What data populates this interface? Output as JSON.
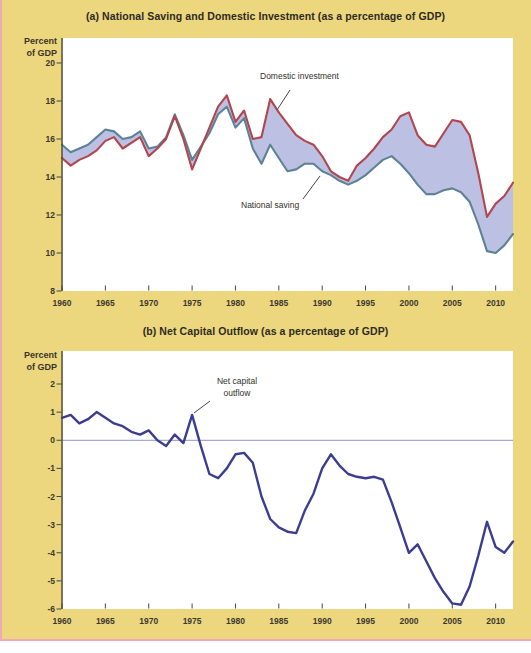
{
  "page": {
    "background": "#ecd77e",
    "edge_pink": "#efaab8",
    "bottom_strip_color": "#ffffff"
  },
  "panel_a": {
    "title": "(a) National Saving and Domestic Investment (as a percentage of GDP)",
    "ylabel_line1": "Percent",
    "ylabel_line2": "of GDP",
    "y_tick_labels": [
      "20",
      "18",
      "16",
      "14",
      "12",
      "10",
      "8"
    ],
    "x_tick_labels": [
      "1960",
      "1965",
      "1970",
      "1975",
      "1980",
      "1985",
      "1990",
      "1995",
      "2000",
      "2005",
      "2010"
    ],
    "annotation_investment": "Domestic investment",
    "annotation_saving": "National saving"
  },
  "panel_b": {
    "title": "(b) Net Capital Outflow (as a percentage of GDP)",
    "ylabel_line1": "Percent",
    "ylabel_line2": "of GDP",
    "y_tick_labels": [
      "2",
      "1",
      "0",
      "-1",
      "-2",
      "-3",
      "-4",
      "-5",
      "-6"
    ],
    "x_tick_labels": [
      "1960",
      "1965",
      "1970",
      "1975",
      "1980",
      "1985",
      "1990",
      "1995",
      "2000",
      "2005",
      "2010"
    ],
    "annotation_line1": "Net capital",
    "annotation_line2": "outflow"
  },
  "chart_data": [
    {
      "type": "line",
      "title": "(a) National Saving and Domestic Investment (as a percentage of GDP)",
      "ylabel": "Percent of GDP",
      "xlim": [
        1960,
        2012
      ],
      "ylim": [
        8,
        20
      ],
      "grid": false,
      "legend_position": "inline-annotations",
      "band_fill": "#b8bee2",
      "x": [
        1960,
        1961,
        1962,
        1963,
        1964,
        1965,
        1966,
        1967,
        1968,
        1969,
        1970,
        1971,
        1972,
        1973,
        1974,
        1975,
        1976,
        1977,
        1978,
        1979,
        1980,
        1981,
        1982,
        1983,
        1984,
        1985,
        1986,
        1987,
        1988,
        1989,
        1990,
        1991,
        1992,
        1993,
        1994,
        1995,
        1996,
        1997,
        1998,
        1999,
        2000,
        2001,
        2002,
        2003,
        2004,
        2005,
        2006,
        2007,
        2008,
        2009,
        2010,
        2011,
        2012
      ],
      "series": [
        {
          "name": "Domestic investment",
          "color": "#b2454d",
          "values": [
            15.0,
            14.6,
            14.9,
            15.1,
            15.4,
            15.9,
            16.1,
            15.5,
            15.8,
            16.1,
            15.1,
            15.5,
            16.0,
            17.2,
            16.0,
            14.4,
            15.5,
            16.6,
            17.7,
            18.3,
            16.9,
            17.5,
            16.0,
            16.1,
            18.1,
            17.4,
            16.8,
            16.2,
            15.9,
            15.7,
            15.1,
            14.3,
            14.0,
            13.8,
            14.6,
            15.0,
            15.5,
            16.1,
            16.5,
            17.2,
            17.4,
            16.2,
            15.7,
            15.6,
            16.3,
            17.0,
            16.9,
            16.2,
            14.2,
            11.9,
            12.6,
            13.0,
            13.7
          ]
        },
        {
          "name": "National saving",
          "color": "#5d8295",
          "values": [
            15.7,
            15.3,
            15.5,
            15.7,
            16.1,
            16.5,
            16.4,
            16.0,
            16.1,
            16.4,
            15.5,
            15.6,
            16.1,
            17.3,
            16.2,
            14.9,
            15.6,
            16.3,
            17.3,
            17.7,
            16.6,
            17.1,
            15.5,
            14.7,
            15.7,
            15.0,
            14.3,
            14.4,
            14.7,
            14.7,
            14.3,
            14.1,
            13.8,
            13.6,
            13.8,
            14.1,
            14.5,
            14.9,
            15.1,
            14.7,
            14.2,
            13.6,
            13.1,
            13.1,
            13.3,
            13.4,
            13.2,
            12.7,
            11.5,
            10.1,
            10.0,
            10.4,
            11.0
          ]
        }
      ]
    },
    {
      "type": "line",
      "title": "(b) Net Capital Outflow (as a percentage of GDP)",
      "ylabel": "Percent of GDP",
      "xlim": [
        1960,
        2012
      ],
      "ylim": [
        -6,
        2
      ],
      "grid": false,
      "zero_line": true,
      "zero_line_color": "#9193c9",
      "x": [
        1960,
        1961,
        1962,
        1963,
        1964,
        1965,
        1966,
        1967,
        1968,
        1969,
        1970,
        1971,
        1972,
        1973,
        1974,
        1975,
        1976,
        1977,
        1978,
        1979,
        1980,
        1981,
        1982,
        1983,
        1984,
        1985,
        1986,
        1987,
        1988,
        1989,
        1990,
        1991,
        1992,
        1993,
        1994,
        1995,
        1996,
        1997,
        1998,
        1999,
        2000,
        2001,
        2002,
        2003,
        2004,
        2005,
        2006,
        2007,
        2008,
        2009,
        2010,
        2011,
        2012
      ],
      "series": [
        {
          "name": "Net capital outflow",
          "color": "#3b3d91",
          "values": [
            0.8,
            0.9,
            0.6,
            0.75,
            1.0,
            0.8,
            0.6,
            0.5,
            0.3,
            0.2,
            0.35,
            0.0,
            -0.2,
            0.2,
            -0.1,
            0.9,
            -0.2,
            -1.2,
            -1.35,
            -1.0,
            -0.5,
            -0.45,
            -0.8,
            -2.0,
            -2.8,
            -3.1,
            -3.25,
            -3.3,
            -2.5,
            -1.9,
            -1.0,
            -0.5,
            -0.9,
            -1.2,
            -1.3,
            -1.35,
            -1.3,
            -1.4,
            -2.2,
            -3.1,
            -4.0,
            -3.7,
            -4.3,
            -4.9,
            -5.4,
            -5.8,
            -5.85,
            -5.2,
            -4.1,
            -2.9,
            -3.8,
            -4.0,
            -3.6
          ]
        }
      ]
    }
  ]
}
